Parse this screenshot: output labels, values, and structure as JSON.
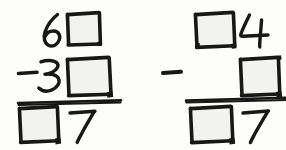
{
  "worksheet": {
    "title": "Handwritten subtraction problems with missing digits",
    "ink_color": "#171717",
    "paper_color": "#fdfdfc",
    "box_fill_color": "#f2f2f0",
    "problem_count": 2
  },
  "problems": [
    {
      "id": "problem-left",
      "operation": "subtraction",
      "minuend": {
        "label": "6",
        "tens_digit": "6",
        "ones_digit": "",
        "ones_is_blank_box": true
      },
      "subtrahend": {
        "operator": "−",
        "operator_label": "minus-sign",
        "tens_digit": "3",
        "ones_digit": "",
        "ones_is_blank_box": true
      },
      "difference": {
        "tens_digit": "",
        "tens_is_blank_box": true,
        "ones_digit": "7"
      },
      "rule_label": "answer-rule"
    },
    {
      "id": "problem-right",
      "operation": "subtraction",
      "minuend": {
        "tens_digit": "",
        "tens_is_blank_box": true,
        "ones_digit": "4"
      },
      "subtrahend": {
        "operator": "−",
        "operator_label": "minus-sign",
        "tens_digit": "",
        "ones_digit": "",
        "ones_is_blank_box": true
      },
      "difference": {
        "tens_digit": "",
        "tens_is_blank_box": true,
        "ones_digit": "7"
      },
      "rule_label": "answer-rule"
    }
  ],
  "glyphs": {
    "six": "6",
    "three": "3",
    "four": "4",
    "seven_left": "7",
    "seven_right": "7",
    "minus_left": "−",
    "minus_right": "−"
  }
}
